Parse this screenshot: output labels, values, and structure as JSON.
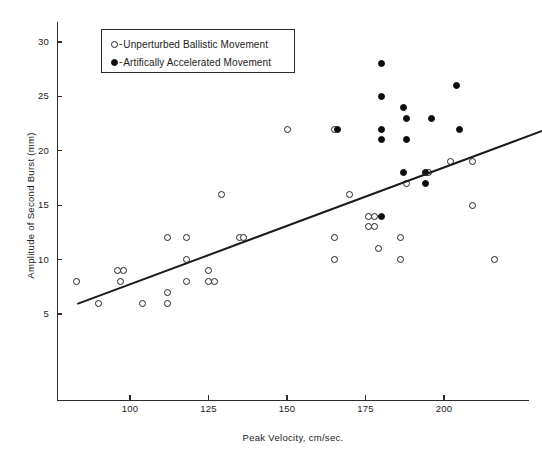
{
  "chart_data": {
    "type": "scatter",
    "title": "",
    "xlabel": "Peak Velocity, cm/sec.",
    "ylabel": "Amplitude of Second Burst  (mm)",
    "xlim": [
      83,
      233
    ],
    "ylim": [
      0,
      32
    ],
    "xticks": [
      100,
      125,
      150,
      175,
      200
    ],
    "yticks": [
      5,
      10,
      15,
      20,
      25,
      30
    ],
    "grid": false,
    "legend_position": "top-left-inside",
    "legend": [
      {
        "marker": "open-circle",
        "dash": "-",
        "label": "Unperturbed Ballistic Movement"
      },
      {
        "marker": "filled-circle",
        "dash": "-",
        "label": "Artifically Accelerated Movement"
      }
    ],
    "series": [
      {
        "name": "Unperturbed Ballistic Movement",
        "marker": "open-circle",
        "points": [
          [
            83,
            8
          ],
          [
            90,
            6
          ],
          [
            96,
            9
          ],
          [
            98,
            9
          ],
          [
            97,
            8
          ],
          [
            104,
            6
          ],
          [
            112,
            12
          ],
          [
            118,
            12
          ],
          [
            118,
            10
          ],
          [
            125,
            9
          ],
          [
            118,
            8
          ],
          [
            125,
            8
          ],
          [
            127,
            8
          ],
          [
            112,
            7
          ],
          [
            112,
            6
          ],
          [
            129,
            16
          ],
          [
            135,
            12
          ],
          [
            136,
            12
          ],
          [
            150,
            22
          ],
          [
            165,
            22
          ],
          [
            170,
            16
          ],
          [
            176,
            14
          ],
          [
            178,
            14
          ],
          [
            176,
            13
          ],
          [
            178,
            13
          ],
          [
            165,
            12
          ],
          [
            186,
            12
          ],
          [
            179,
            11
          ],
          [
            165,
            10
          ],
          [
            186,
            10
          ],
          [
            188,
            17
          ],
          [
            195,
            18
          ],
          [
            202,
            19
          ],
          [
            209,
            19
          ],
          [
            209,
            15
          ],
          [
            216,
            10
          ]
        ]
      },
      {
        "name": "Artifically Accelerated Movement",
        "marker": "filled-circle",
        "points": [
          [
            180,
            28
          ],
          [
            180,
            25
          ],
          [
            188,
            23
          ],
          [
            196,
            23
          ],
          [
            187,
            24
          ],
          [
            204,
            26
          ],
          [
            205,
            22
          ],
          [
            180,
            22
          ],
          [
            166,
            22
          ],
          [
            180,
            21
          ],
          [
            188,
            21
          ],
          [
            180,
            14
          ],
          [
            194,
            18
          ],
          [
            187,
            18
          ],
          [
            194,
            17
          ]
        ]
      }
    ],
    "trendline": {
      "x_start": 83,
      "y_start": 6.0,
      "x_end": 231,
      "y_end": 21.9
    }
  }
}
